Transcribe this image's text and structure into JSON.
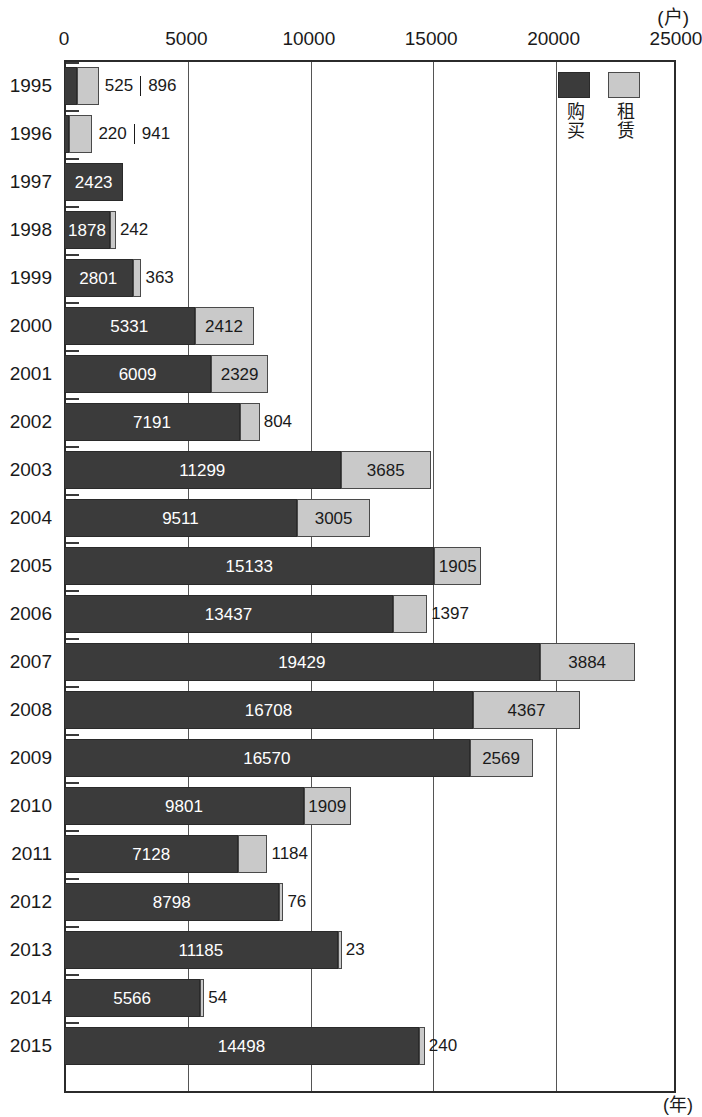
{
  "unit_caption": "(户)",
  "y_axis_unit": "(年)",
  "legend": {
    "entries": [
      {
        "label": "购买",
        "color": "#3b3b3b",
        "key": "buy"
      },
      {
        "label": "租赁",
        "color": "#c9c9c9",
        "key": "rent"
      }
    ]
  },
  "chart_data": {
    "type": "bar",
    "orientation": "horizontal",
    "stacked": true,
    "title": "",
    "subtitle": "",
    "xlabel": "(户)",
    "ylabel": "(年)",
    "xlim": [
      0,
      25000
    ],
    "xticks": [
      0,
      5000,
      10000,
      15000,
      20000,
      25000
    ],
    "xtick_labels": [
      "0",
      "5000",
      "10000",
      "15000",
      "20000",
      "25000"
    ],
    "grid": true,
    "grid_axis": "x",
    "legend_position": "top-right",
    "categories": [
      "1995",
      "1996",
      "1997",
      "1998",
      "1999",
      "2000",
      "2001",
      "2002",
      "2003",
      "2004",
      "2005",
      "2006",
      "2007",
      "2008",
      "2009",
      "2010",
      "2011",
      "2012",
      "2013",
      "2014",
      "2015"
    ],
    "series": [
      {
        "name": "购买",
        "color": "#3b3b3b",
        "values": [
          525,
          220,
          2423,
          1878,
          2801,
          5331,
          6009,
          7191,
          11299,
          9511,
          15133,
          13437,
          19429,
          16708,
          16570,
          9801,
          7128,
          8798,
          11185,
          5566,
          14498
        ]
      },
      {
        "name": "租赁",
        "color": "#c9c9c9",
        "values": [
          896,
          941,
          0,
          242,
          363,
          2412,
          2329,
          804,
          3685,
          3005,
          1905,
          1397,
          3884,
          4367,
          2569,
          1909,
          1184,
          76,
          23,
          54,
          240
        ]
      }
    ],
    "rows": [
      {
        "year": "1995",
        "buy": 525,
        "buy_label": "525",
        "rent": 896,
        "rent_label": "896",
        "label_mode": "paired-outside"
      },
      {
        "year": "1996",
        "buy": 220,
        "buy_label": "220",
        "rent": 941,
        "rent_label": "941",
        "label_mode": "paired-outside"
      },
      {
        "year": "1997",
        "buy": 2423,
        "buy_label": "2423",
        "rent": 0,
        "rent_label": "",
        "label_mode": "buy-inside"
      },
      {
        "year": "1998",
        "buy": 1878,
        "buy_label": "1878",
        "rent": 242,
        "rent_label": "242",
        "label_mode": "buy-inside-rent-outside"
      },
      {
        "year": "1999",
        "buy": 2801,
        "buy_label": "2801",
        "rent": 363,
        "rent_label": "363",
        "label_mode": "buy-inside-rent-outside"
      },
      {
        "year": "2000",
        "buy": 5331,
        "buy_label": "5331",
        "rent": 2412,
        "rent_label": "2412",
        "label_mode": "both-inside"
      },
      {
        "year": "2001",
        "buy": 6009,
        "buy_label": "6009",
        "rent": 2329,
        "rent_label": "2329",
        "label_mode": "both-inside"
      },
      {
        "year": "2002",
        "buy": 7191,
        "buy_label": "7191",
        "rent": 804,
        "rent_label": "804",
        "label_mode": "buy-inside-rent-outside"
      },
      {
        "year": "2003",
        "buy": 11299,
        "buy_label": "11299",
        "rent": 3685,
        "rent_label": "3685",
        "label_mode": "both-inside"
      },
      {
        "year": "2004",
        "buy": 9511,
        "buy_label": "9511",
        "rent": 3005,
        "rent_label": "3005",
        "label_mode": "both-inside"
      },
      {
        "year": "2005",
        "buy": 15133,
        "buy_label": "15133",
        "rent": 1905,
        "rent_label": "1905",
        "label_mode": "both-inside"
      },
      {
        "year": "2006",
        "buy": 13437,
        "buy_label": "13437",
        "rent": 1397,
        "rent_label": "1397",
        "label_mode": "buy-inside-rent-outside"
      },
      {
        "year": "2007",
        "buy": 19429,
        "buy_label": "19429",
        "rent": 3884,
        "rent_label": "3884",
        "label_mode": "both-inside"
      },
      {
        "year": "2008",
        "buy": 16708,
        "buy_label": "16708",
        "rent": 4367,
        "rent_label": "4367",
        "label_mode": "both-inside"
      },
      {
        "year": "2009",
        "buy": 16570,
        "buy_label": "16570",
        "rent": 2569,
        "rent_label": "2569",
        "label_mode": "both-inside"
      },
      {
        "year": "2010",
        "buy": 9801,
        "buy_label": "9801",
        "rent": 1909,
        "rent_label": "1909",
        "label_mode": "both-inside"
      },
      {
        "year": "2011",
        "buy": 7128,
        "buy_label": "7128",
        "rent": 1184,
        "rent_label": "1184",
        "label_mode": "buy-inside-rent-outside"
      },
      {
        "year": "2012",
        "buy": 8798,
        "buy_label": "8798",
        "rent": 76,
        "rent_label": "76",
        "label_mode": "buy-inside-rent-outside"
      },
      {
        "year": "2013",
        "buy": 11185,
        "buy_label": "11185",
        "rent": 23,
        "rent_label": "23",
        "label_mode": "buy-inside-rent-outside"
      },
      {
        "year": "2014",
        "buy": 5566,
        "buy_label": "5566",
        "rent": 54,
        "rent_label": "54",
        "label_mode": "buy-inside-rent-outside"
      },
      {
        "year": "2015",
        "buy": 14498,
        "buy_label": "14498",
        "rent": 240,
        "rent_label": "240",
        "label_mode": "buy-inside-rent-outside"
      }
    ]
  }
}
